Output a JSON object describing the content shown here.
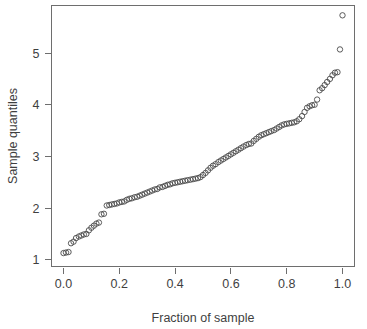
{
  "chart_data": {
    "type": "scatter",
    "title": "",
    "subtitle": "",
    "xlabel": "Fraction of sample",
    "ylabel": "Sample quantiles",
    "xlim": [
      -0.043,
      1.043
    ],
    "ylim": [
      0.87,
      5.92
    ],
    "xticks": [
      0.0,
      0.2,
      0.4,
      0.6,
      0.8,
      1.0
    ],
    "xticklabels": [
      "0.0",
      "0.2",
      "0.4",
      "0.6",
      "0.8",
      "1.0"
    ],
    "yticks": [
      1,
      2,
      3,
      4,
      5
    ],
    "yticklabels": [
      "1",
      "2",
      "3",
      "4",
      "5"
    ],
    "grid": false,
    "legend": null,
    "marker": "open-circle",
    "marker_color": "#4a4a4a",
    "frame": "box",
    "series": [
      {
        "name": "sample quantiles",
        "x": [
          0.0,
          0.009,
          0.018,
          0.027,
          0.036,
          0.045,
          0.055,
          0.064,
          0.073,
          0.082,
          0.091,
          0.1,
          0.109,
          0.118,
          0.127,
          0.136,
          0.145,
          0.155,
          0.164,
          0.173,
          0.182,
          0.191,
          0.2,
          0.209,
          0.218,
          0.227,
          0.236,
          0.245,
          0.255,
          0.264,
          0.273,
          0.282,
          0.291,
          0.3,
          0.309,
          0.318,
          0.327,
          0.336,
          0.345,
          0.355,
          0.364,
          0.373,
          0.382,
          0.391,
          0.4,
          0.409,
          0.418,
          0.427,
          0.436,
          0.445,
          0.455,
          0.464,
          0.473,
          0.482,
          0.491,
          0.5,
          0.509,
          0.518,
          0.527,
          0.536,
          0.545,
          0.555,
          0.564,
          0.573,
          0.582,
          0.591,
          0.6,
          0.609,
          0.618,
          0.627,
          0.636,
          0.645,
          0.655,
          0.664,
          0.673,
          0.682,
          0.691,
          0.7,
          0.709,
          0.718,
          0.727,
          0.736,
          0.745,
          0.755,
          0.764,
          0.773,
          0.782,
          0.791,
          0.8,
          0.809,
          0.818,
          0.827,
          0.836,
          0.845,
          0.855,
          0.864,
          0.873,
          0.882,
          0.891,
          0.9,
          0.909,
          0.918,
          0.927,
          0.936,
          0.945,
          0.955,
          0.964,
          0.973,
          0.982,
          0.991,
          1.0
        ],
        "y": [
          1.13,
          1.14,
          1.15,
          1.32,
          1.35,
          1.42,
          1.45,
          1.47,
          1.49,
          1.5,
          1.57,
          1.62,
          1.66,
          1.7,
          1.72,
          1.88,
          1.89,
          2.05,
          2.06,
          2.07,
          2.08,
          2.09,
          2.11,
          2.12,
          2.13,
          2.16,
          2.18,
          2.19,
          2.21,
          2.22,
          2.24,
          2.26,
          2.28,
          2.3,
          2.32,
          2.34,
          2.36,
          2.37,
          2.4,
          2.41,
          2.43,
          2.45,
          2.46,
          2.48,
          2.49,
          2.5,
          2.51,
          2.52,
          2.53,
          2.54,
          2.55,
          2.56,
          2.57,
          2.58,
          2.6,
          2.64,
          2.68,
          2.73,
          2.78,
          2.82,
          2.85,
          2.89,
          2.92,
          2.95,
          2.98,
          3.01,
          3.04,
          3.07,
          3.1,
          3.13,
          3.16,
          3.19,
          3.22,
          3.24,
          3.25,
          3.3,
          3.34,
          3.38,
          3.41,
          3.43,
          3.45,
          3.47,
          3.49,
          3.51,
          3.54,
          3.57,
          3.6,
          3.62,
          3.63,
          3.64,
          3.65,
          3.66,
          3.68,
          3.72,
          3.78,
          3.86,
          3.94,
          3.97,
          3.99,
          4.0,
          4.1,
          4.28,
          4.32,
          4.38,
          4.44,
          4.5,
          4.57,
          4.62,
          4.63,
          5.07,
          5.73
        ]
      }
    ],
    "notes": {
      "point_count": 111,
      "description": "Monotone increasing quantile (ECDF-style) plot with open circular markers; step-like jump near fraction 0.15 and a high outlier at fraction 1.0."
    }
  },
  "axes": {
    "x_title": "Fraction of sample",
    "y_title": "Sample quantiles"
  }
}
